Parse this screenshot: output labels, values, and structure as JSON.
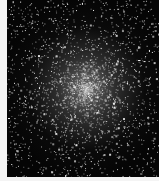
{
  "image": {
    "subject": "globular star cluster",
    "alt": "Dense globular star cluster on a black sky background",
    "background_color": "#050505",
    "border_color": "#f4f4f4",
    "star_color": "#ffffff",
    "core_center": [
      0.52,
      0.5
    ]
  }
}
